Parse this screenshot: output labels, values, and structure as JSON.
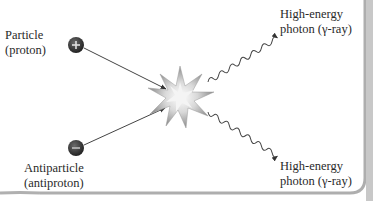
{
  "diagram": {
    "particle": {
      "name": "Particle",
      "detail": "(proton)",
      "charge_symbol": "+"
    },
    "antiparticle": {
      "name": "Antiparticle",
      "detail": "(antiproton)",
      "charge_symbol": "−"
    },
    "photon_top": {
      "name": "High-energy",
      "detail": "photon (γ-ray)"
    },
    "photon_bottom": {
      "name": "High-energy",
      "detail": "photon (γ-ray)"
    },
    "colors": {
      "particle_fill": "#3a3a3a",
      "line": "#444444",
      "burst": "#b8b8b8",
      "border_shadow": "#9a9a9a",
      "background": "#ffffff"
    }
  }
}
